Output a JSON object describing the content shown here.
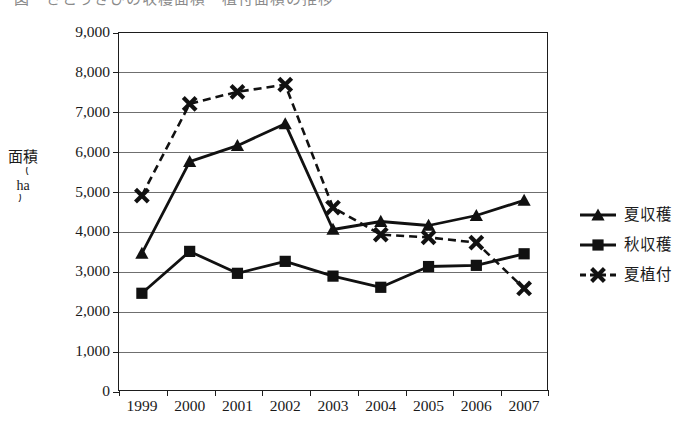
{
  "title": {
    "text": "図　さとうきびの収穫面積・植付面積の推移",
    "cropped": true
  },
  "axes": {
    "y_title_main": "面積",
    "y_title_unit": "ha",
    "y_paren_open": "（",
    "y_paren_close": "）",
    "y_ticks": [
      "9,000",
      "8,000",
      "7,000",
      "6,000",
      "5,000",
      "4,000",
      "3,000",
      "2,000",
      "1,000",
      "0"
    ],
    "x_ticks": [
      "1999",
      "2000",
      "2001",
      "2002",
      "2003",
      "2004",
      "2005",
      "2006",
      "2007"
    ]
  },
  "legend": {
    "position": "right",
    "items": [
      {
        "label": "夏収穫",
        "marker": "triangle-marker-icon",
        "line": "solid",
        "color": "#111111"
      },
      {
        "label": "秋収穫",
        "marker": "square-marker-icon",
        "line": "solid",
        "color": "#111111"
      },
      {
        "label": "夏植付",
        "marker": "cross-marker-icon",
        "line": "dashed",
        "color": "#111111"
      }
    ]
  },
  "chart_data": {
    "type": "line",
    "title": "図　さとうきびの収穫面積・植付面積の推移",
    "xlabel": "",
    "ylabel": "面積（ha）",
    "categories": [
      "1999",
      "2000",
      "2001",
      "2002",
      "2003",
      "2004",
      "2005",
      "2006",
      "2007"
    ],
    "ylim": [
      0,
      9000
    ],
    "ytick_interval": 1000,
    "grid": true,
    "legend_position": "right",
    "series": [
      {
        "name": "夏収穫",
        "marker": "triangle",
        "line_style": "solid",
        "color": "#111111",
        "values": [
          3450,
          5750,
          6150,
          6700,
          4050,
          4250,
          4150,
          4400,
          4780
        ]
      },
      {
        "name": "秋収穫",
        "marker": "square",
        "line_style": "solid",
        "color": "#111111",
        "values": [
          2450,
          3500,
          2950,
          3250,
          2880,
          2600,
          3120,
          3150,
          3440
        ]
      },
      {
        "name": "夏植付",
        "marker": "cross",
        "line_style": "dashed",
        "color": "#111111",
        "values": [
          4900,
          7200,
          7500,
          7680,
          4600,
          3920,
          3850,
          3720,
          2570
        ]
      }
    ]
  }
}
